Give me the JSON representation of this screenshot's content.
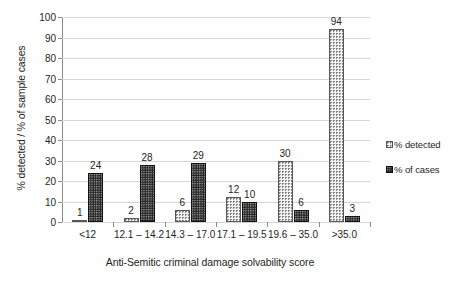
{
  "chart_data": {
    "type": "bar",
    "title": "",
    "xlabel": "Anti-Semitic criminal damage solvability score",
    "ylabel": "% detected / % of sample cases",
    "categories": [
      "<12",
      "12.1 – 14.2",
      "14.3 – 17.0",
      "17.1 – 19.5",
      "19.6 – 35.0",
      ">35.0"
    ],
    "series": [
      {
        "name": "% detected",
        "values": [
          1,
          2,
          6,
          12,
          30,
          94
        ],
        "fill": "light-dotted",
        "color": "#f2f2f2"
      },
      {
        "name": "% of cases",
        "values": [
          24,
          28,
          29,
          10,
          6,
          3
        ],
        "fill": "dark-dotted",
        "color": "#262626"
      }
    ],
    "ylim": [
      0,
      100
    ],
    "yticks": [
      0,
      10,
      20,
      30,
      40,
      50,
      60,
      70,
      80,
      90,
      100
    ],
    "ytick_labels": [
      "0",
      "10",
      "20",
      "30",
      "40",
      "50",
      "60",
      "70",
      "80",
      "90",
      "100"
    ],
    "grid": true,
    "grid_axis": "y",
    "legend_position": "right",
    "data_labels": true
  },
  "legend": {
    "items": [
      {
        "label": "% detected"
      },
      {
        "label": "% of cases"
      }
    ]
  }
}
